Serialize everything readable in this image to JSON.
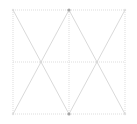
{
  "figure": {
    "title": "",
    "canvas": {
      "width": 137,
      "height": 124,
      "background": "#ffffff"
    },
    "plot_area": {
      "x0": 13,
      "y0": 10,
      "x1": 125,
      "y1": 114
    },
    "colors": {
      "background": "#ffffff",
      "grid_line": "#d9d9d9",
      "diagonal_line": "#c8c8c8",
      "vertex_marker": "#9a9a9a"
    },
    "style": {
      "grid_dash": "1,1",
      "grid_width": 0.9,
      "diagonal_width": 0.7,
      "marker_radius": 1.6
    }
  },
  "chart_data": {
    "type": "diagram",
    "title": "",
    "subtitle": "",
    "xlabel": "",
    "ylabel": "",
    "xlim": [
      13,
      125
    ],
    "ylim": [
      10,
      114
    ],
    "grid": true,
    "legend": null,
    "tick_labels_x": [],
    "tick_labels_y": [],
    "annotations": [],
    "grid_x_positions": [
      13,
      69,
      125
    ],
    "grid_y_positions": [
      10,
      62,
      114
    ],
    "cells_x": 2,
    "cells_y": 2,
    "triangles_total": 8,
    "cells": [
      {
        "name": "top-left",
        "x0": 13,
        "y0": 10,
        "x1": 69,
        "y1": 62,
        "shape": "V",
        "apex": [
          41,
          62
        ]
      },
      {
        "name": "top-right",
        "x0": 69,
        "y0": 10,
        "x1": 125,
        "y1": 62,
        "shape": "V",
        "apex": [
          97,
          62
        ]
      },
      {
        "name": "bottom-left",
        "x0": 13,
        "y0": 62,
        "x1": 69,
        "y1": 114,
        "shape": "A",
        "apex": [
          41,
          62
        ]
      },
      {
        "name": "bottom-right",
        "x0": 69,
        "y0": 62,
        "x1": 125,
        "y1": 114,
        "shape": "A",
        "apex": [
          97,
          62
        ]
      }
    ],
    "diagonal_segments": [
      {
        "x1": 13,
        "y1": 10,
        "x2": 41,
        "y2": 62
      },
      {
        "x1": 41,
        "y1": 62,
        "x2": 69,
        "y2": 10
      },
      {
        "x1": 69,
        "y1": 10,
        "x2": 97,
        "y2": 62
      },
      {
        "x1": 97,
        "y1": 62,
        "x2": 125,
        "y2": 10
      },
      {
        "x1": 13,
        "y1": 114,
        "x2": 41,
        "y2": 62
      },
      {
        "x1": 41,
        "y1": 62,
        "x2": 69,
        "y2": 114
      },
      {
        "x1": 69,
        "y1": 114,
        "x2": 97,
        "y2": 62
      },
      {
        "x1": 97,
        "y1": 62,
        "x2": 125,
        "y2": 114
      }
    ],
    "vertex_markers": [
      {
        "x": 69,
        "y": 10,
        "emphasis": "strong"
      },
      {
        "x": 69,
        "y": 114,
        "emphasis": "strong"
      },
      {
        "x": 13,
        "y": 10,
        "emphasis": "weak"
      },
      {
        "x": 125,
        "y": 10,
        "emphasis": "weak"
      },
      {
        "x": 13,
        "y": 114,
        "emphasis": "weak"
      },
      {
        "x": 125,
        "y": 114,
        "emphasis": "weak"
      },
      {
        "x": 41,
        "y": 62,
        "emphasis": "weak"
      },
      {
        "x": 97,
        "y": 62,
        "emphasis": "weak"
      }
    ]
  }
}
